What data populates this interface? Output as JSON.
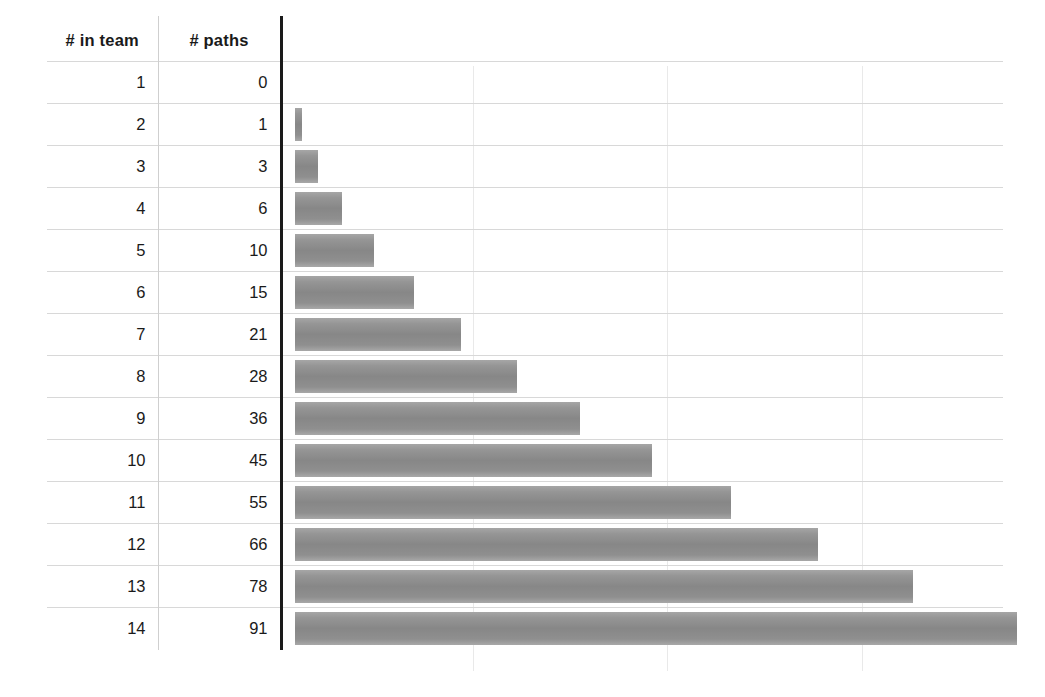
{
  "chart_data": {
    "type": "bar",
    "orientation": "horizontal",
    "title": "",
    "xlabel": "",
    "ylabel": "",
    "categories": [
      "1",
      "2",
      "3",
      "4",
      "5",
      "6",
      "7",
      "8",
      "9",
      "10",
      "11",
      "12",
      "13",
      "14"
    ],
    "values": [
      0,
      1,
      3,
      6,
      10,
      15,
      21,
      28,
      36,
      45,
      55,
      66,
      78,
      91
    ],
    "series": [
      {
        "name": "# paths",
        "values": [
          0,
          1,
          3,
          6,
          10,
          15,
          21,
          28,
          36,
          45,
          55,
          66,
          78,
          91
        ]
      }
    ],
    "xlim": [
      0,
      91
    ],
    "gridlines_at": [
      25,
      50,
      75
    ],
    "grid": true,
    "legend": false,
    "bar_color": "#8c8c8c",
    "axis_color": "#1a1a1a"
  },
  "table": {
    "headers": {
      "team": "# in team",
      "paths": "# paths",
      "bars": ""
    },
    "rows": [
      {
        "team": "1",
        "paths": "0",
        "value": 0
      },
      {
        "team": "2",
        "paths": "1",
        "value": 1
      },
      {
        "team": "3",
        "paths": "3",
        "value": 3
      },
      {
        "team": "4",
        "paths": "6",
        "value": 6
      },
      {
        "team": "5",
        "paths": "10",
        "value": 10
      },
      {
        "team": "6",
        "paths": "15",
        "value": 15
      },
      {
        "team": "7",
        "paths": "21",
        "value": 21
      },
      {
        "team": "8",
        "paths": "28",
        "value": 28
      },
      {
        "team": "9",
        "paths": "36",
        "value": 36
      },
      {
        "team": "10",
        "paths": "45",
        "value": 45
      },
      {
        "team": "11",
        "paths": "55",
        "value": 55
      },
      {
        "team": "12",
        "paths": "66",
        "value": 66
      },
      {
        "team": "13",
        "paths": "78",
        "value": 78
      },
      {
        "team": "14",
        "paths": "91",
        "value": 91
      }
    ]
  },
  "layout": {
    "px_per_unit": 7.93,
    "gridline_x": [
      473,
      667,
      862
    ],
    "grid_color": "#e9e9e9",
    "rule_color": "#d8d8d8",
    "divider_color": "#cfcfcf",
    "background": "#ffffff"
  }
}
